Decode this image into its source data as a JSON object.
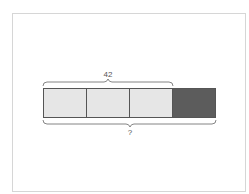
{
  "diagram": {
    "type": "tape-diagram",
    "segments": [
      {
        "fill": "#e6e6e6",
        "shaded": false
      },
      {
        "fill": "#e6e6e6",
        "shaded": false
      },
      {
        "fill": "#e6e6e6",
        "shaded": false
      },
      {
        "fill": "#5c5c5c",
        "shaded": true
      }
    ],
    "top_brace": {
      "label": "42",
      "spans_segments": 3
    },
    "bottom_brace": {
      "label": "?",
      "spans_segments": 4
    }
  },
  "colors": {
    "light_segment": "#e6e6e6",
    "dark_segment": "#5c5c5c",
    "outline": "#555555",
    "frame_border": "#d6d6d6"
  }
}
